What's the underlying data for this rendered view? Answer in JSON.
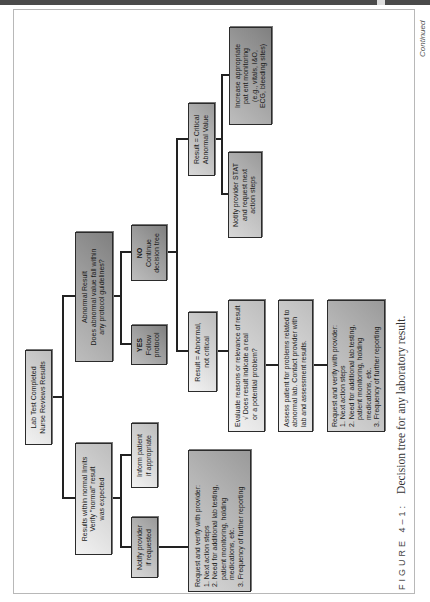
{
  "diagram": {
    "nodes": {
      "root": {
        "lines": [
          "Lab Test Completed",
          "Nurse Reviews Results"
        ]
      },
      "normal": {
        "lines": [
          "Results within normal limits",
          "Verify \"normal\" result",
          "was expected"
        ]
      },
      "abnormal": {
        "lines": [
          "Abnormal Result",
          "Does abnormal value fall within",
          "any protocol guidelines?"
        ]
      },
      "inform_patient": {
        "lines": [
          "Inform patient",
          "if appropriate"
        ]
      },
      "notify_if_requested": {
        "lines": [
          "Notify provider",
          "if requested"
        ]
      },
      "yes": {
        "lines": [
          "YES",
          "Follow",
          "protocol"
        ]
      },
      "no": {
        "lines": [
          "NO",
          "Continue",
          "decision tree"
        ]
      },
      "not_critical": {
        "lines": [
          "Result = Abnormal,",
          "not critical"
        ]
      },
      "critical": {
        "lines": [
          "Result = Critical",
          "Abnormal Value"
        ]
      },
      "request_left": {
        "lines": [
          "Request and verify with provider:",
          "1. Next action steps",
          "2. Need for additional lab testing,",
          "patient monitoring, holding",
          "medications, etc.",
          "3. Frequency of further reporting"
        ]
      },
      "notify_stat": {
        "lines": [
          "Notify provider STAT",
          "and request next",
          "action steps"
        ]
      },
      "increase_monitoring": {
        "lines": [
          "Increase appropriate",
          "pat ent monitoring",
          "(e.g., vitals, I&O,",
          "ECG, bleeding sites)"
        ]
      },
      "evaluate": {
        "lines": [
          "Evaluate reasons or relevance of result",
          "Does result indicate a real",
          "or a potential problem?"
        ]
      },
      "assess": {
        "lines": [
          "Assess patient for problems related to",
          "abnormal lab. Contact provider with",
          "lab and assessment results."
        ]
      },
      "request_right": {
        "lines": [
          "Request and verify with provider:",
          "1. Next action steps",
          "2. Need for additional lab testing,",
          "patient monitoring, holding medications, etc.",
          "3. Frequency of further reporting"
        ]
      }
    },
    "edges": [
      [
        "root",
        "normal"
      ],
      [
        "root",
        "abnormal"
      ],
      [
        "normal",
        "inform_patient"
      ],
      [
        "normal",
        "notify_if_requested"
      ],
      [
        "notify_if_requested",
        "request_left"
      ],
      [
        "abnormal",
        "yes"
      ],
      [
        "abnormal",
        "no"
      ],
      [
        "no",
        "not_critical"
      ],
      [
        "no",
        "critical"
      ],
      [
        "critical",
        "notify_stat"
      ],
      [
        "critical",
        "increase_monitoring"
      ],
      [
        "not_critical",
        "evaluate"
      ],
      [
        "evaluate",
        "assess"
      ],
      [
        "assess",
        "request_right"
      ]
    ],
    "checkmark_glyph": "√"
  },
  "caption": {
    "figure_label": "FIGURE 4–1:",
    "title": "Decision tree for any laboratory result."
  },
  "continued_label": "Continued"
}
